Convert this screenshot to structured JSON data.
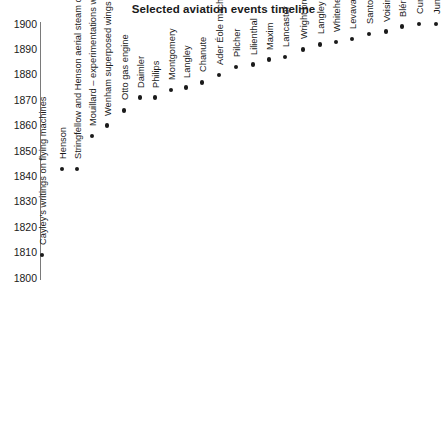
{
  "title": "Selected aviation events timeline",
  "axis": {
    "y_ticks": [
      1900,
      1890,
      1880,
      1870,
      1860,
      1850,
      1840,
      1830,
      1820,
      1810,
      1800
    ],
    "y_min": 1800,
    "y_max": 1900
  },
  "colors": {
    "marker": "#1a1a1a",
    "axis": "#7a7a7a",
    "text": "#1a1a1a",
    "background": "#ffffff"
  },
  "chart_data": {
    "type": "scatter",
    "title": "Selected aviation events timeline",
    "xlabel": "",
    "ylabel": "",
    "ylim": [
      1800,
      1900
    ],
    "grid": false,
    "legend": "none",
    "x": [
      1,
      2,
      3,
      4,
      5,
      6,
      7,
      8,
      9,
      10,
      11,
      12,
      13,
      14,
      15,
      16,
      17,
      18,
      19,
      20,
      21,
      22,
      23,
      24,
      25
    ],
    "categories": [
      "Cayley's writings on flying machines",
      "Henson",
      "Stringfellow and Henson aerial steam carriage",
      "Mouillard – experimentations with gliders",
      "Wenham superposed wings",
      "Otto gas engine",
      "Daimler",
      "Philips",
      "Montgomery",
      "Langley",
      "Chanute",
      "Ader Éole machine",
      "Pilcher",
      "Lilienthal",
      "Maxim",
      "Lancaster",
      "Wright brothers",
      "Langley",
      "Whitehead",
      "Levavasseur",
      "Santos Dumont",
      "Voisin",
      "Blériot Channel flight",
      "Curtis AEA flights",
      "Junkers"
    ],
    "values": [
      1809,
      1843,
      1843,
      1856,
      1860,
      1866,
      1871,
      1871,
      1874,
      1875,
      1877,
      1880,
      1883,
      1884,
      1886,
      1887,
      1890,
      1892,
      1893,
      1894,
      1896,
      1897,
      1899,
      1900,
      1900
    ]
  },
  "events": [
    {
      "label": "Cayley's writings on flying machines",
      "year": 1809,
      "px": 42
    },
    {
      "label": "Henson",
      "year": 1843,
      "px": 62
    },
    {
      "label": "Stringfellow and Henson aerial steam carriage",
      "year": 1843,
      "px": 77
    },
    {
      "label": "Mouillard – experimentations with gliders",
      "year": 1856,
      "px": 92
    },
    {
      "label": "Wenham superposed wings",
      "year": 1860,
      "px": 107
    },
    {
      "label": "Otto gas engine",
      "year": 1866,
      "px": 124
    },
    {
      "label": "Daimler",
      "year": 1871,
      "px": 140
    },
    {
      "label": "Philips",
      "year": 1871,
      "px": 155
    },
    {
      "label": "Montgomery",
      "year": 1874,
      "px": 171
    },
    {
      "label": "Langley",
      "year": 1875,
      "px": 186
    },
    {
      "label": "Chanute",
      "year": 1877,
      "px": 202
    },
    {
      "label": "Ader Éole machine",
      "year": 1880,
      "px": 219
    },
    {
      "label": "Pilcher",
      "year": 1883,
      "px": 236
    },
    {
      "label": "Lilienthal",
      "year": 1884,
      "px": 253
    },
    {
      "label": "Maxim",
      "year": 1886,
      "px": 269
    },
    {
      "label": "Lancaster",
      "year": 1887,
      "px": 285
    },
    {
      "label": "Wright brothers",
      "year": 1890,
      "px": 303
    },
    {
      "label": "Langley",
      "year": 1892,
      "px": 320
    },
    {
      "label": "Whitehead",
      "year": 1893,
      "px": 336
    },
    {
      "label": "Levavasseur",
      "year": 1894,
      "px": 352
    },
    {
      "label": "Santos Dumont",
      "year": 1896,
      "px": 369
    },
    {
      "label": "Voisin",
      "year": 1897,
      "px": 386
    },
    {
      "label": "Blériot Channel flight",
      "year": 1899,
      "px": 402
    },
    {
      "label": "Curtis AEA flights",
      "year": 1900,
      "px": 419
    },
    {
      "label": "Junkers",
      "year": 1900,
      "px": 436
    }
  ]
}
